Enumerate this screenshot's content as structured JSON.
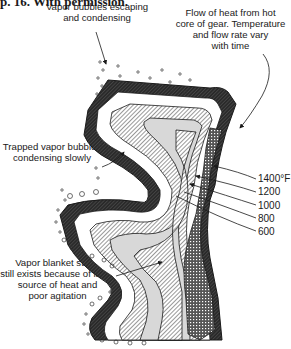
{
  "caption": "p. 16. With permission.",
  "annotations": {
    "vapor_escaping": [
      "Vapor bubbles escaping",
      "and condensing"
    ],
    "heat_flow": [
      "Flow of heat from hot",
      "core of gear. Temperature",
      "and flow rate vary",
      "with time"
    ],
    "trapped_vapor": [
      "Trapped vapor bubbles",
      "condensing slowly"
    ],
    "vapor_blanket": [
      "Vapor blanket stage",
      "still exists because of large",
      "source of heat and",
      "poor agitation"
    ]
  },
  "isotherms": {
    "unit": "°F",
    "labels": [
      "1400°F",
      "1200",
      "1000",
      "800",
      "600"
    ]
  },
  "colors": {
    "ink": "#1a1a1a",
    "dark_band": "#3a3a3a",
    "light_band": "#d8d8d8",
    "background": "#ffffff"
  }
}
